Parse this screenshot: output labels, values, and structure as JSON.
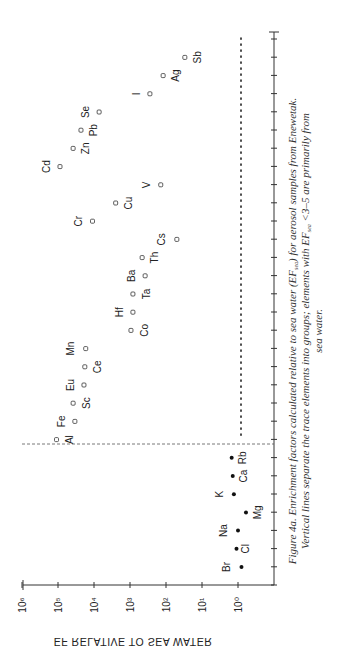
{
  "chart_data": {
    "type": "scatter",
    "title": "",
    "xlabel": "",
    "ylabel": "EF RELATIVE TO SEA WATER",
    "yscale": "log",
    "ylim": [
      0.1,
      1000000
    ],
    "y_tick_labels": [
      "10⁰",
      "10¹",
      "10²",
      "10³",
      "10⁴",
      "10⁵",
      "10⁶"
    ],
    "y_tick_values": [
      1,
      10,
      100,
      1000,
      10000,
      100000,
      1000000
    ],
    "orientation": "rotated 90° clockwise on page",
    "grid": false,
    "legend": null,
    "categories": [
      "Br",
      "Cl",
      "Na",
      "Mg",
      "K",
      "Ca",
      "Rb",
      "Al",
      "Fe",
      "Sc",
      "Eu",
      "Ce",
      "Mn",
      "Co",
      "Hf",
      "Ta",
      "Ba",
      "Th",
      "Cs",
      "Cr",
      "Cu",
      "V",
      "Cd",
      "Zn",
      "Pb",
      "Se",
      "I",
      "Ag",
      "Sb"
    ],
    "series": [
      {
        "name": "Sea-water elements (filled markers)",
        "marker": "filled-circle",
        "points": [
          {
            "element": "Br",
            "ef": 0.8
          },
          {
            "element": "Cl",
            "ef": 1.1
          },
          {
            "element": "Na",
            "ef": 1.0
          },
          {
            "element": "Mg",
            "ef": 0.6
          },
          {
            "element": "K",
            "ef": 1.3
          },
          {
            "element": "Ca",
            "ef": 1.4
          },
          {
            "element": "Rb",
            "ef": 1.5
          }
        ]
      },
      {
        "name": "Enriched trace elements (open markers)",
        "marker": "open-square",
        "points": [
          {
            "element": "Al",
            "ef": 110000
          },
          {
            "element": "Fe",
            "ef": 34000
          },
          {
            "element": "Sc",
            "ef": 38000
          },
          {
            "element": "Eu",
            "ef": 19000
          },
          {
            "element": "Ce",
            "ef": 18000
          },
          {
            "element": "Mn",
            "ef": 17000
          },
          {
            "element": "Co",
            "ef": 940
          },
          {
            "element": "Hf",
            "ef": 830
          },
          {
            "element": "Ta",
            "ef": 830
          },
          {
            "element": "Ba",
            "ef": 380
          },
          {
            "element": "Th",
            "ef": 460
          },
          {
            "element": "Cs",
            "ef": 50
          },
          {
            "element": "Cr",
            "ef": 11000
          },
          {
            "element": "Cu",
            "ef": 2500
          },
          {
            "element": "V",
            "ef": 140
          },
          {
            "element": "Cd",
            "ef": 88000
          },
          {
            "element": "Zn",
            "ef": 38000
          },
          {
            "element": "Pb",
            "ef": 23000
          },
          {
            "element": "Se",
            "ef": 7200
          },
          {
            "element": "I",
            "ef": 280
          },
          {
            "element": "Ag",
            "ef": 120
          },
          {
            "element": "Sb",
            "ef": 30
          }
        ]
      }
    ],
    "annotations": [
      {
        "type": "dashed-vertical-line",
        "between": [
          "Rb",
          "Al"
        ],
        "description": "separates sea-water elements from trace elements"
      },
      {
        "type": "dotted-horizontal-line",
        "ef": 0.8,
        "span": [
          "Al",
          "Sb"
        ]
      }
    ]
  },
  "axis": {
    "title": "EF RELATIVE TO SEA WATER",
    "ticks": [
      "10⁶",
      "10⁵",
      "10⁴",
      "10³",
      "10²",
      "10¹",
      "10⁰"
    ]
  },
  "caption": {
    "line1": "Figure 4a. Enrichment factors calculated relative to sea water (EF",
    "sub1": "sea",
    "line1b": ") for aerosol samples from Enewetak.",
    "line2a": "Vertical lines separate the trace elements into groups; elements with EF",
    "sub2": "sea",
    "line2b": " <3–5 are primarily from",
    "line3": "sea water."
  },
  "labels": {
    "Br": {
      "dx": -14,
      "dy": 0
    },
    "Cl": {
      "dx": 10,
      "dy": 0
    },
    "Na": {
      "dx": -14,
      "dy": 0
    },
    "Mg": {
      "dx": 12,
      "dy": 0
    },
    "K": {
      "dx": -14,
      "dy": 0
    },
    "Ca": {
      "dx": 12,
      "dy": 0
    },
    "Rb": {
      "dx": 12,
      "dy": 0
    },
    "Al": {
      "dx": 14,
      "dy": 0
    },
    "Fe": {
      "dx": -13,
      "dy": 0
    },
    "Sc": {
      "dx": 14,
      "dy": 0
    },
    "Eu": {
      "dx": -13,
      "dy": 0
    },
    "Ce": {
      "dx": 14,
      "dy": 0
    },
    "Mn": {
      "dx": -14,
      "dy": 0
    },
    "Co": {
      "dx": 14,
      "dy": 0
    },
    "Hf": {
      "dx": -13,
      "dy": 0
    },
    "Ta": {
      "dx": 14,
      "dy": 0
    },
    "Ba": {
      "dx": -13,
      "dy": 0
    },
    "Th": {
      "dx": 13,
      "dy": 0
    },
    "Cs": {
      "dx": -14,
      "dy": 0
    },
    "Cr": {
      "dx": -13,
      "dy": 0
    },
    "Cu": {
      "dx": 14,
      "dy": 0
    },
    "V": {
      "dx": -13,
      "dy": 0
    },
    "Cd": {
      "dx": -13,
      "dy": 0
    },
    "Zn": {
      "dx": 13,
      "dy": 0
    },
    "Pb": {
      "dx": 13,
      "dy": 0
    },
    "Se": {
      "dx": -13,
      "dy": 0
    },
    "I": {
      "dx": -13,
      "dy": 0
    },
    "Ag": {
      "dx": 13,
      "dy": 0
    },
    "Sb": {
      "dx": 14,
      "dy": 0
    }
  }
}
